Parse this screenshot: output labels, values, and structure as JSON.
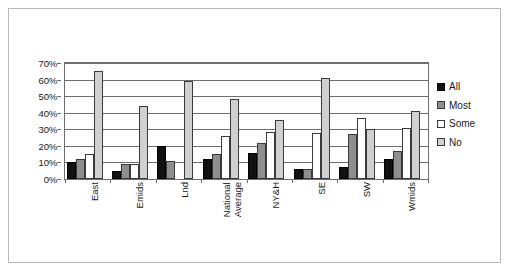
{
  "chart_data": {
    "type": "bar",
    "title": "",
    "subtitle": "",
    "xlabel": "",
    "ylabel": "",
    "ylim": [
      0,
      70
    ],
    "ytick_labels": [
      "70%",
      "60%",
      "50%",
      "40%",
      "30%",
      "20%",
      "10%",
      "0%"
    ],
    "ytick_values": [
      70,
      60,
      50,
      40,
      30,
      20,
      10,
      0
    ],
    "grid": true,
    "legend_position": "right",
    "categories": [
      "East",
      "Emids",
      "Lnd",
      "National Average",
      "NY&H",
      "SE",
      "SW",
      "Wmids"
    ],
    "category_lines": [
      [
        "East"
      ],
      [
        "Emids"
      ],
      [
        "Lnd"
      ],
      [
        "National",
        "Average"
      ],
      [
        "NY&H"
      ],
      [
        "SE"
      ],
      [
        "SW"
      ],
      [
        "Wmids"
      ]
    ],
    "series": [
      {
        "name": "All",
        "color": "#111111",
        "values": [
          10,
          5,
          20,
          12,
          16,
          6,
          7,
          12
        ]
      },
      {
        "name": "Most",
        "color": "#8e8e8e",
        "values": [
          12,
          9,
          11,
          15,
          21.5,
          6,
          27,
          17
        ]
      },
      {
        "name": "Some",
        "color": "#ffffff",
        "values": [
          15,
          9,
          0,
          26,
          28.5,
          28,
          37,
          31
        ]
      },
      {
        "name": "No",
        "color": "#d0d0d0",
        "values": [
          65,
          44,
          59,
          48.5,
          35.5,
          61,
          30,
          41
        ]
      }
    ]
  },
  "legend": {
    "items": [
      {
        "label": "All"
      },
      {
        "label": "Most"
      },
      {
        "label": "Some"
      },
      {
        "label": "No"
      }
    ]
  }
}
